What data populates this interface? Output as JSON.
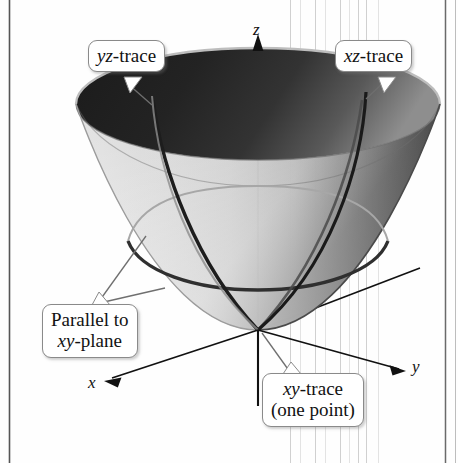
{
  "figure": {
    "background_color": "#fefefe",
    "surface": {
      "outer_light_color": "#d2d2d2",
      "outer_mid_color": "#9a9a9a",
      "inner_rim_dark_color": "#2a2a2a",
      "trace_line_color": "#333333",
      "hidden_trace_color": "#9b9b9b"
    }
  },
  "axes": {
    "z": {
      "label": "z",
      "direction": "up"
    },
    "y": {
      "label": "y",
      "direction": "right-down"
    },
    "x": {
      "label": "x",
      "direction": "left-down"
    },
    "origin_label": "vertex at origin",
    "axis_color": "#111111"
  },
  "callouts": {
    "yz_trace": {
      "line1_italic": "yz",
      "line1_rest": "-trace"
    },
    "xz_trace": {
      "line1_italic": "xz",
      "line1_rest": "-trace"
    },
    "parallel_xy": {
      "line1": "Parallel to",
      "line2_italic": "xy",
      "line2_rest": "-plane"
    },
    "xy_trace": {
      "line1_italic": "xy",
      "line1_rest": "-trace",
      "line2": "(one point)"
    }
  },
  "borders": {
    "left_rule_color": "#555555",
    "right_rule_color": "#666666",
    "scan_line_color": "#c9c9c9"
  }
}
